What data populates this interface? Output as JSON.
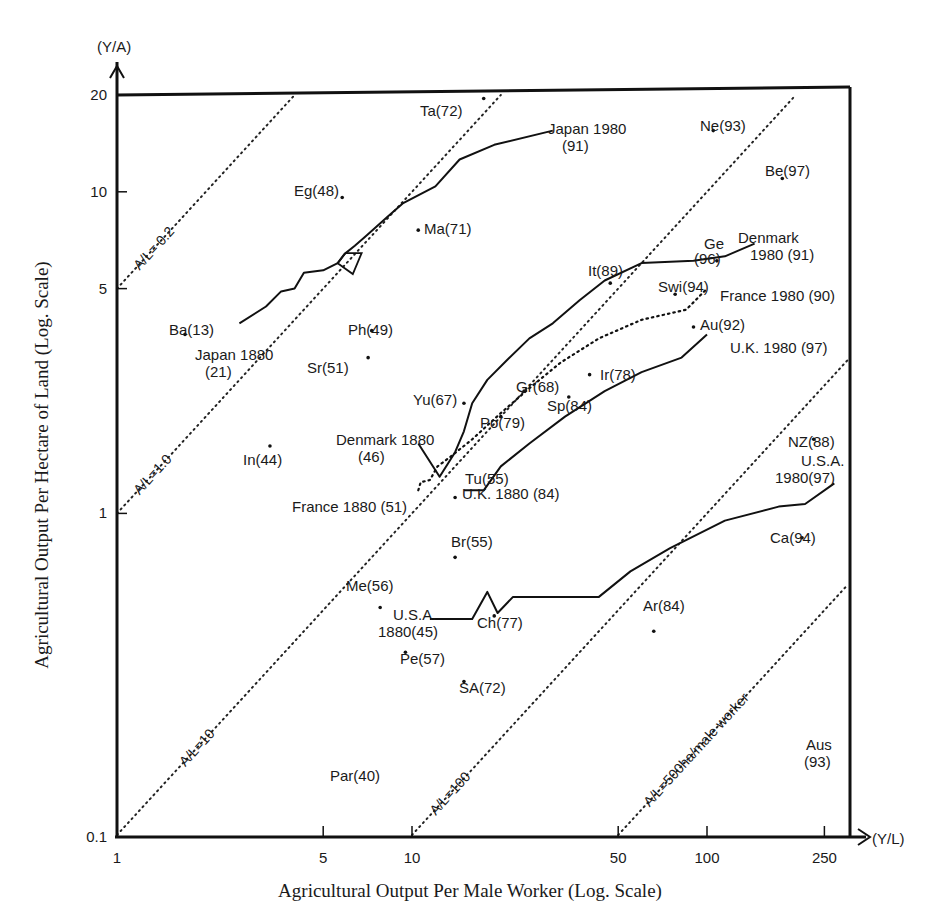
{
  "chart_data": {
    "type": "scatter",
    "title": "",
    "xlabel": "Agricultural Output Per Male Worker (Log. Scale)",
    "ylabel": "Agricultural Output Per Hectare of Land (Log. Scale)",
    "x_axis_unit_label": "(Y/L)",
    "y_axis_unit_label": "(Y/A)",
    "x_scale": "log",
    "y_scale": "log",
    "xlim": [
      1,
      300
    ],
    "ylim": [
      0.1,
      20
    ],
    "x_ticks": [
      {
        "value": 1,
        "label": "1"
      },
      {
        "value": 5,
        "label": "5"
      },
      {
        "value": 10,
        "label": "10"
      },
      {
        "value": 50,
        "label": "50"
      },
      {
        "value": 100,
        "label": "100"
      },
      {
        "value": 250,
        "label": "250"
      }
    ],
    "y_ticks": [
      {
        "value": 0.1,
        "label": "0.1"
      },
      {
        "value": 1,
        "label": "1"
      },
      {
        "value": 5,
        "label": "5"
      },
      {
        "value": 10,
        "label": "10"
      },
      {
        "value": 20,
        "label": "20"
      }
    ],
    "grid": false,
    "reference_lines": [
      {
        "ratio": 0.2,
        "label": "A/L= 0.2"
      },
      {
        "ratio": 1.0,
        "label": "A/L=1.0"
      },
      {
        "ratio": 10,
        "label": "A/L=10"
      },
      {
        "ratio": 100,
        "label": "A/L=100"
      },
      {
        "ratio": 500,
        "label": "A/L=500ha/male worker"
      }
    ],
    "points": [
      {
        "label": "Ta(72)",
        "x": 17.5,
        "y": 19.5
      },
      {
        "label": "Ne(93)",
        "x": 105,
        "y": 15.5
      },
      {
        "label": "Be(97)",
        "x": 180,
        "y": 11
      },
      {
        "label": "Eg(48)",
        "x": 5.8,
        "y": 9.6
      },
      {
        "label": "Ma(71)",
        "x": 10.5,
        "y": 7.6
      },
      {
        "label": "Ge(96)",
        "x": 108,
        "y": 6.1
      },
      {
        "label": "It(89)",
        "x": 47,
        "y": 5.2
      },
      {
        "label": "Swi(94)",
        "x": 78,
        "y": 4.8
      },
      {
        "label": "Au(92)",
        "x": 90,
        "y": 3.8
      },
      {
        "label": "Ba(13)",
        "x": 1.7,
        "y": 3.6
      },
      {
        "label": "Ph(49)",
        "x": 7.3,
        "y": 3.7
      },
      {
        "label": "Sr(51)",
        "x": 7.1,
        "y": 3.05
      },
      {
        "label": "Ir(78)",
        "x": 40,
        "y": 2.7
      },
      {
        "label": "Yu(67)",
        "x": 15,
        "y": 2.2
      },
      {
        "label": "Gr(68)",
        "x": 24,
        "y": 2.4
      },
      {
        "label": "Sp(84)",
        "x": 34,
        "y": 2.3
      },
      {
        "label": "Po(79)",
        "x": 20,
        "y": 2.0
      },
      {
        "label": "In(44)",
        "x": 3.3,
        "y": 1.62
      },
      {
        "label": "NZ(88)",
        "x": 230,
        "y": 1.7
      },
      {
        "label": "Tu(55)",
        "x": 14,
        "y": 1.12
      },
      {
        "label": "Br(55)",
        "x": 14,
        "y": 0.73
      },
      {
        "label": "Ca(94)",
        "x": 210,
        "y": 0.84
      },
      {
        "label": "Me(56)",
        "x": 7.8,
        "y": 0.51
      },
      {
        "label": "Ch(77)",
        "x": 19,
        "y": 0.48
      },
      {
        "label": "Ar(84)",
        "x": 66,
        "y": 0.43
      },
      {
        "label": "Pe(57)",
        "x": 9.5,
        "y": 0.37
      },
      {
        "label": "SA(72)",
        "x": 15,
        "y": 0.3
      },
      {
        "label": "Par(40)",
        "x": 0,
        "y": 0
      },
      {
        "label": "Aus(93)",
        "x": 0,
        "y": 0
      }
    ],
    "points_without_marker_note": "Par(40) and Aus(93) are labels only",
    "series": [
      {
        "name": "Japan",
        "style": "solid",
        "start_label": "Japan 1880 (21)",
        "end_label": "Japan 1980 (91)",
        "x": [
          2.6,
          3.2,
          3.6,
          4.0,
          4.3,
          5.0,
          5.6,
          5.9,
          6.4,
          7.0,
          8.3,
          9.3,
          12.0,
          14.5,
          19.0,
          30.0
        ],
        "y": [
          3.9,
          4.4,
          4.9,
          5.0,
          5.6,
          5.7,
          6.0,
          6.4,
          6.8,
          7.3,
          8.4,
          9.2,
          10.4,
          12.6,
          14.0,
          15.5
        ]
      },
      {
        "name": "Denmark",
        "style": "solid",
        "start_label": "Denmark 1880 (46)",
        "end_label": "Denmark 1980 (91)",
        "x": [
          10.5,
          12.4,
          14.0,
          15.0,
          16.0,
          18.0,
          21.0,
          25.0,
          30.0,
          37.0,
          45.0,
          60.0,
          90.0,
          115.0,
          145.0
        ],
        "y": [
          1.65,
          1.3,
          1.55,
          1.8,
          2.2,
          2.6,
          3.0,
          3.5,
          3.9,
          4.6,
          5.3,
          6.0,
          6.1,
          6.3,
          6.9
        ]
      },
      {
        "name": "France",
        "style": "dotted",
        "start_label": "France 1880 (51)",
        "end_label": "France 1980 (90)",
        "x": [
          10.5,
          10.7,
          11.5,
          12.2,
          13.5,
          16.0,
          20.0,
          25.0,
          32.0,
          43.0,
          60.0,
          85.0,
          100.0
        ],
        "y": [
          1.18,
          1.25,
          1.27,
          1.4,
          1.5,
          1.7,
          2.05,
          2.45,
          2.95,
          3.5,
          4.0,
          4.3,
          5.0
        ]
      },
      {
        "name": "U.K.",
        "style": "solid",
        "start_label": "U.K. 1880 (84)",
        "end_label": "U.K. 1980 (97)",
        "x": [
          15.0,
          17.5,
          20.0,
          25.0,
          33.0,
          45.0,
          60.0,
          82.0,
          100.0
        ],
        "y": [
          1.18,
          1.18,
          1.4,
          1.65,
          2.0,
          2.4,
          2.75,
          3.05,
          3.6
        ]
      },
      {
        "name": "U.S.A.",
        "style": "solid",
        "start_label": "U.S.A. 1880 (45)",
        "end_label": "U.S.A. 1980 (97)",
        "x": [
          11.5,
          16.0,
          18.0,
          19.5,
          22.0,
          43.0,
          55.0,
          75.0,
          115.0,
          175.0,
          215.0,
          270.0
        ],
        "y": [
          0.47,
          0.47,
          0.57,
          0.49,
          0.55,
          0.55,
          0.66,
          0.78,
          0.95,
          1.05,
          1.07,
          1.24
        ]
      }
    ]
  }
}
